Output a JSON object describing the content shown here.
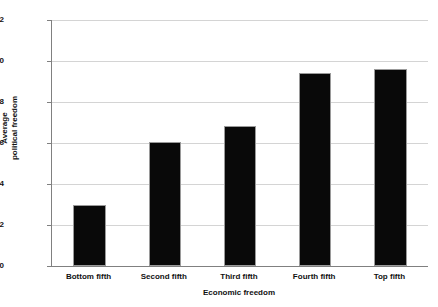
{
  "chart_data": {
    "type": "bar",
    "title": "",
    "xlabel": "Economic freedom",
    "ylabel": "Average political freedom",
    "ylabel_lines": [
      "Average",
      "political freedom"
    ],
    "categories": [
      "Bottom fifth",
      "Second fifth",
      "Third fifth",
      "Fourth fifth",
      "Top fifth"
    ],
    "values": [
      3.0,
      6.05,
      6.85,
      9.4,
      9.6
    ],
    "ylim": [
      0,
      12
    ],
    "yticks": [
      0,
      2,
      4,
      6,
      8,
      10,
      12
    ],
    "ytick_labels": [
      "0",
      "2",
      "4",
      "6",
      "8",
      "10",
      "12"
    ],
    "grid": "horizontal",
    "legend": "none",
    "bar_color": "#090909",
    "gridline_color": "#d4d4d4",
    "axis_color": "#808080"
  }
}
